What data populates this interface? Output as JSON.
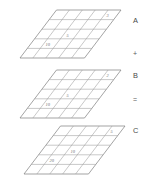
{
  "figure": {
    "stroke_color": "#9a9a9a",
    "outline_color": "#7d7d7d",
    "value_color": "#6f6f6f",
    "label_color": "#4a4a4a",
    "background": "#ffffff",
    "grid_rows": 5,
    "grid_cols": 5
  },
  "layers": [
    {
      "id": "layer-a",
      "name": "A",
      "values": [
        {
          "label": "3",
          "col": 4,
          "row": 0
        },
        {
          "label": "5",
          "col": 2,
          "row": 2
        },
        {
          "label": "10",
          "col": 1,
          "row": 3
        }
      ]
    },
    {
      "id": "layer-b",
      "name": "B",
      "values": [
        {
          "label": "2",
          "col": 4,
          "row": 0
        },
        {
          "label": "5",
          "col": 2,
          "row": 2
        },
        {
          "label": "10",
          "col": 1,
          "row": 3
        }
      ]
    },
    {
      "id": "layer-c",
      "name": "C",
      "values": [
        {
          "label": "5",
          "col": 4,
          "row": 0
        },
        {
          "label": "10",
          "col": 2,
          "row": 2
        },
        {
          "label": "20",
          "col": 1,
          "row": 3
        }
      ]
    }
  ],
  "annotations": {
    "label_a": "A",
    "operator_plus": "+",
    "label_b": "B",
    "operator_equals": "=",
    "label_c": "C"
  }
}
